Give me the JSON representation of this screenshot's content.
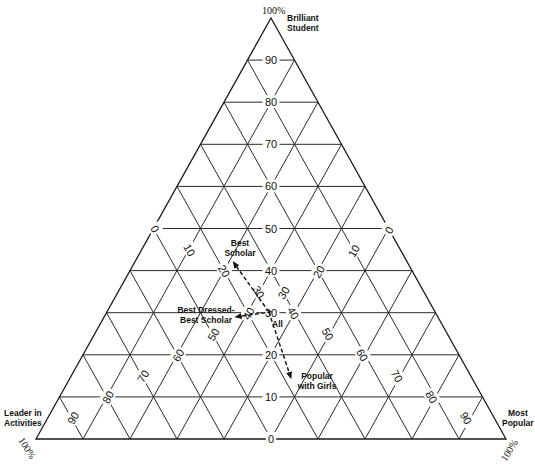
{
  "chart_data": {
    "type": "ternary",
    "title": "",
    "axes": {
      "top": {
        "label": "Brilliant Student",
        "max_label": "100%"
      },
      "left": {
        "label": "Leader in Activities",
        "max_label": "100%"
      },
      "right": {
        "label": "Most Popular",
        "max_label": "100%"
      }
    },
    "ticks": {
      "brilliant_student": [
        "0",
        "10",
        "20",
        "30",
        "40",
        "50",
        "60",
        "70",
        "80",
        "90"
      ],
      "leader_in_activities": [
        "0",
        "10",
        "20",
        "30",
        "40",
        "50",
        "60",
        "70",
        "80",
        "90"
      ],
      "most_popular": [
        "0",
        "10",
        "20",
        "30",
        "40",
        "50",
        "60",
        "70",
        "80",
        "90"
      ]
    },
    "grid": true,
    "grid_step": 10,
    "points": [
      {
        "name": "Best Scholar",
        "label_lines": [
          "Best",
          "Scholar"
        ],
        "brilliant_student": 42,
        "leader_in_activities": 37,
        "most_popular": 21
      },
      {
        "name": "Best Dressed-Best Scholar",
        "label_lines": [
          "Best Dressed-",
          "Best Scholar"
        ],
        "brilliant_student": 29,
        "leader_in_activities": 43,
        "most_popular": 28
      },
      {
        "name": "All",
        "label_lines": [
          "All"
        ],
        "brilliant_student": 29.5,
        "leader_in_activities": 35.5,
        "most_popular": 35
      },
      {
        "name": "Popular with Girls",
        "label_lines": [
          "Popular",
          "with Girls"
        ],
        "brilliant_student": 14.5,
        "leader_in_activities": 38.5,
        "most_popular": 47
      }
    ],
    "arrows": [
      {
        "from": "All",
        "to": "Best Scholar",
        "style": "dashed"
      },
      {
        "from": "All",
        "to": "Best Dressed-Best Scholar",
        "style": "dashed"
      },
      {
        "from": "All",
        "to": "Popular with Girls",
        "style": "dashed"
      }
    ]
  },
  "labels": {
    "top_pct": "100%",
    "top_name_1": "Brilliant",
    "top_name_2": "Student",
    "left_name_1": "Leader in",
    "left_name_2": "Activities",
    "left_pct": "100%",
    "right_name_1": "Most",
    "right_name_2": "Popular",
    "right_pct": "100%"
  }
}
